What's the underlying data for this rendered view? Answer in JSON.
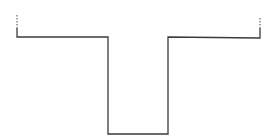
{
  "diagram": {
    "type": "line-profile",
    "stroke_color": "#3a3a3a",
    "background": "#ffffff",
    "profile_points": [
      [
        17,
        28
      ],
      [
        17,
        37
      ],
      [
        108,
        37
      ],
      [
        108,
        134
      ],
      [
        168,
        134
      ],
      [
        168,
        37
      ],
      [
        260,
        38
      ],
      [
        260,
        28
      ]
    ],
    "left_dashed_extension": [
      [
        17,
        15
      ],
      [
        17,
        28
      ]
    ],
    "right_dashed_extension": [
      [
        260,
        18
      ],
      [
        260,
        28
      ]
    ]
  }
}
